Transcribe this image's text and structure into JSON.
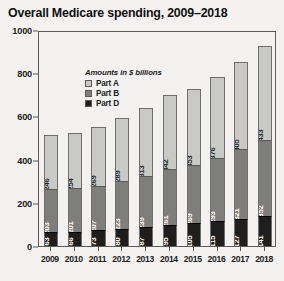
{
  "chart_data": {
    "type": "bar",
    "subtype": "stacked",
    "title": "Overall Medicare spending, 2009–2018",
    "xlabel": "",
    "ylabel": "",
    "note": "Amounts in $ billions",
    "categories": [
      "2009",
      "2010",
      "2011",
      "2012",
      "2013",
      "2014",
      "2015",
      "2016",
      "2017",
      "2018"
    ],
    "series": [
      {
        "name": "Part A",
        "color": "#c9c9c6",
        "values": [
          246,
          254,
          269,
          289,
          313,
          342,
          353,
          376,
          405,
          433
        ],
        "labels": [
          "$246",
          "$254",
          "$269",
          "$289",
          "$313",
          "$342",
          "$353",
          "$376",
          "$405",
          "$433"
        ]
      },
      {
        "name": "Part B",
        "color": "#7e7e7c",
        "values": [
          203,
          201,
          207,
          223,
          239,
          261,
          269,
          293,
          321,
          352
        ],
        "labels": [
          "$203",
          "$201",
          "$207",
          "$223",
          "$239",
          "$261",
          "$269",
          "$293",
          "$321",
          "$352"
        ]
      },
      {
        "name": "Part D",
        "color": "#1e1e1e",
        "values": [
          63,
          66,
          73,
          80,
          87,
          95,
          105,
          115,
          127,
          141
        ],
        "labels": [
          "$63",
          "$66",
          "$73",
          "$80",
          "$87",
          "$95",
          "$105",
          "$115",
          "$127",
          "$141"
        ]
      }
    ],
    "stack_order_bottom_to_top": [
      "Part D",
      "Part B",
      "Part A"
    ],
    "yticks": [
      0,
      200,
      400,
      600,
      800,
      1000
    ],
    "ytick_labels": [
      "0",
      "200",
      "400",
      "600",
      "800",
      "1000"
    ],
    "ylim": [
      0,
      1000
    ],
    "grid": false,
    "legend_position": "top-left"
  },
  "legend": {
    "note": "Amounts in $ billions",
    "entries": [
      {
        "label": "Part A"
      },
      {
        "label": "Part B"
      },
      {
        "label": "Part D"
      }
    ]
  }
}
